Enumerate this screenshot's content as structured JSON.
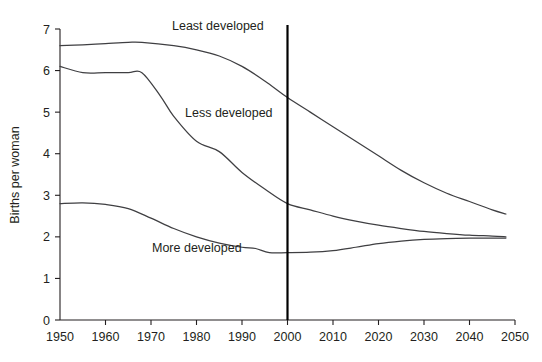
{
  "chart_data": {
    "type": "line",
    "title": "",
    "subtitle": "",
    "xlabel": "",
    "ylabel": "Births per woman",
    "xlim": [
      1950,
      2050
    ],
    "ylim": [
      0,
      7
    ],
    "grid": false,
    "legend_position": "inline-labels",
    "x_ticks": [
      "1950",
      "1960",
      "1970",
      "1980",
      "1990",
      "2000",
      "2010",
      "2020",
      "2030",
      "2040",
      "2050"
    ],
    "y_ticks": [
      "0",
      "1",
      "2",
      "3",
      "4",
      "5",
      "6",
      "7"
    ],
    "annotations": [
      {
        "name": "projection-divider",
        "type": "vertical-line",
        "x": 2000,
        "label": ""
      }
    ],
    "series": [
      {
        "name": "Least developed",
        "label_x": 2000,
        "x": [
          1950,
          1955,
          1960,
          1965,
          1968,
          1975,
          1980,
          1985,
          1990,
          1995,
          2000,
          2005,
          2010,
          2015,
          2020,
          2025,
          2030,
          2035,
          2040,
          2045,
          2048
        ],
        "values": [
          6.6,
          6.62,
          6.65,
          6.68,
          6.68,
          6.6,
          6.5,
          6.35,
          6.1,
          5.75,
          5.35,
          5.0,
          4.65,
          4.3,
          3.95,
          3.6,
          3.3,
          3.05,
          2.85,
          2.65,
          2.55
        ]
      },
      {
        "name": "Less developed",
        "label_x": 1978,
        "x": [
          1950,
          1955,
          1960,
          1965,
          1968,
          1972,
          1975,
          1980,
          1985,
          1990,
          1995,
          2000,
          2005,
          2010,
          2015,
          2020,
          2025,
          2030,
          2035,
          2040,
          2045,
          2048
        ],
        "values": [
          6.1,
          5.95,
          5.95,
          5.95,
          5.95,
          5.4,
          4.9,
          4.3,
          4.05,
          3.55,
          3.15,
          2.8,
          2.65,
          2.5,
          2.38,
          2.28,
          2.2,
          2.13,
          2.08,
          2.04,
          2.02,
          2.0
        ]
      },
      {
        "name": "More developed",
        "label_x": 1972,
        "x": [
          1950,
          1955,
          1960,
          1965,
          1970,
          1975,
          1980,
          1985,
          1990,
          1993,
          1996,
          2000,
          2005,
          2010,
          2015,
          2020,
          2025,
          2030,
          2035,
          2040,
          2045,
          2048
        ],
        "values": [
          2.8,
          2.82,
          2.78,
          2.68,
          2.45,
          2.2,
          2.0,
          1.85,
          1.75,
          1.72,
          1.62,
          1.62,
          1.63,
          1.67,
          1.75,
          1.84,
          1.9,
          1.94,
          1.96,
          1.97,
          1.97,
          1.97
        ]
      }
    ]
  },
  "style": {
    "line_color": "#3f3f42",
    "axis_color": "#231f20",
    "marker_color": "#000000",
    "background": "#ffffff"
  }
}
